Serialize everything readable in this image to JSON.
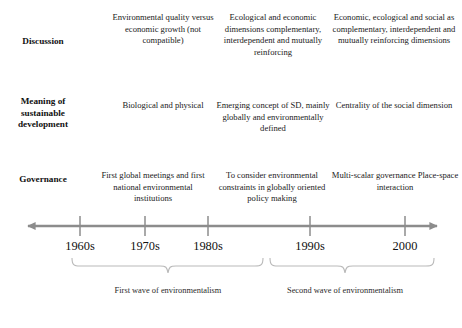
{
  "figure": {
    "type": "timeline-diagram",
    "accent_color": "#8c8c8c",
    "brace_color": "#b9b9b9",
    "text_color": "#1a1a1a"
  },
  "rows": [
    {
      "label": "Discussion",
      "cells": [
        "Environmental quality versus economic growth (not compatible)",
        "Ecological and economic dimensions complementary, interdependent and mutually reinforcing",
        "Economic, ecological and social as complementary, interdependent and mutually reinforcing dimensions"
      ]
    },
    {
      "label": "Meaning of sustainable development",
      "cells": [
        "Biological and physical",
        "Emerging concept of SD, mainly globally and environmentally defined",
        "Centrality of the social dimension"
      ]
    },
    {
      "label": "Governance",
      "cells": [
        "First global meetings and first national environmental institutions",
        "To consider environmental constraints in globally oriented policy making",
        "Multi-scalar governance Place-space interaction"
      ]
    }
  ],
  "timeline": {
    "ticks": [
      {
        "label": "1960s",
        "x": 80
      },
      {
        "label": "1970s",
        "x": 145
      },
      {
        "label": "1980s",
        "x": 208
      },
      {
        "label": "1990s",
        "x": 310
      },
      {
        "label": "2000",
        "x": 405
      }
    ],
    "axis_start_x": 20,
    "axis_end_x": 445,
    "direction": "both"
  },
  "waves": [
    {
      "caption": "First wave of environmentalism",
      "start_x": 72,
      "end_x": 263
    },
    {
      "caption": "Second wave of environmentalism",
      "start_x": 270,
      "end_x": 434
    }
  ]
}
